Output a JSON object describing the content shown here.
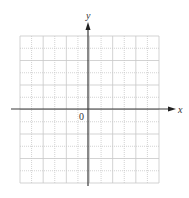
{
  "diagram": {
    "type": "coordinate-plane",
    "grid": {
      "columns": 12,
      "rows": 12,
      "left": 20,
      "top": 36,
      "right": 159,
      "bottom": 183,
      "line_color": "#c8c8c8",
      "line_style": "dotted"
    },
    "axes": {
      "color": "#3a3a3a",
      "x_axis": {
        "label": "x",
        "y": 109,
        "from": 11,
        "to": 176
      },
      "y_axis": {
        "label": "y",
        "x": 88,
        "from": 186,
        "to": 22
      }
    },
    "origin_label": "0"
  }
}
